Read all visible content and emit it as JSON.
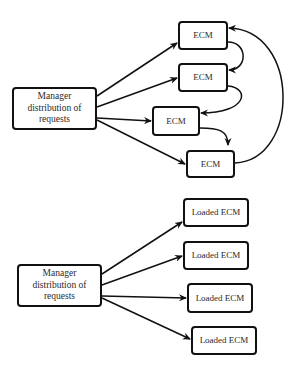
{
  "diagram_top": {
    "manager": {
      "label": "Manager distribution of requests",
      "lines": [
        "Manager",
        "distribution of",
        "requests"
      ]
    },
    "nodes": [
      {
        "id": "ecm1",
        "label": "ECM"
      },
      {
        "id": "ecm2",
        "label": "ECM"
      },
      {
        "id": "ecm3",
        "label": "ECM"
      },
      {
        "id": "ecm4",
        "label": "ECM"
      }
    ],
    "edges": [
      {
        "from": "manager",
        "to": "ecm1"
      },
      {
        "from": "manager",
        "to": "ecm2"
      },
      {
        "from": "manager",
        "to": "ecm3"
      },
      {
        "from": "manager",
        "to": "ecm4"
      },
      {
        "from": "ecm1",
        "to": "ecm2",
        "style": "curved"
      },
      {
        "from": "ecm2",
        "to": "ecm3",
        "style": "curved"
      },
      {
        "from": "ecm3",
        "to": "ecm4",
        "style": "curved"
      },
      {
        "from": "ecm4",
        "to": "ecm1",
        "style": "curved-loop"
      }
    ]
  },
  "diagram_bottom": {
    "manager": {
      "label": "Manager distribution of requests",
      "lines": [
        "Manager",
        "distribution of",
        "requests"
      ]
    },
    "nodes": [
      {
        "id": "loaded1",
        "label": "Loaded ECM"
      },
      {
        "id": "loaded2",
        "label": "Loaded ECM"
      },
      {
        "id": "loaded3",
        "label": "Loaded ECM"
      },
      {
        "id": "loaded4",
        "label": "Loaded ECM"
      }
    ],
    "edges": [
      {
        "from": "manager",
        "to": "loaded1"
      },
      {
        "from": "manager",
        "to": "loaded2"
      },
      {
        "from": "manager",
        "to": "loaded3"
      },
      {
        "from": "manager",
        "to": "loaded4"
      }
    ]
  },
  "colors": {
    "stroke": "#111111",
    "text": "#2a2a2a",
    "background": "#ffffff"
  }
}
